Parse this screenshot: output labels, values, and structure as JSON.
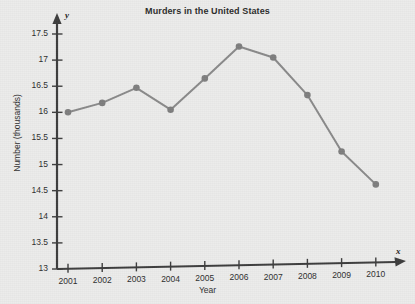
{
  "chart_data": {
    "type": "line",
    "title": "Murders in the United States",
    "xlabel": "Year",
    "ylabel": "Number (thousands)",
    "x_axis_symbol": "x",
    "y_axis_symbol": "y",
    "categories": [
      "2001",
      "2002",
      "2003",
      "2004",
      "2005",
      "2006",
      "2007",
      "2008",
      "2009",
      "2010"
    ],
    "values": [
      16.0,
      16.18,
      16.47,
      16.05,
      16.65,
      17.26,
      17.05,
      16.33,
      15.25,
      14.62
    ],
    "ylim": [
      13,
      17.5
    ],
    "yticks": [
      "13",
      "13.5",
      "14",
      "14.5",
      "15",
      "15.5",
      "16",
      "16.5",
      "17",
      "17.5"
    ],
    "ytick_values": [
      13,
      13.5,
      14,
      14.5,
      15,
      15.5,
      16,
      16.5,
      17,
      17.5
    ],
    "grid": false,
    "legend": null,
    "marker": "circle",
    "series_color": "#8a8a8a",
    "axis_color": "#3d3d3d",
    "background_color": "#ececeb",
    "plot_background_color": "#ededec",
    "text_color": "#2e2e2e"
  }
}
